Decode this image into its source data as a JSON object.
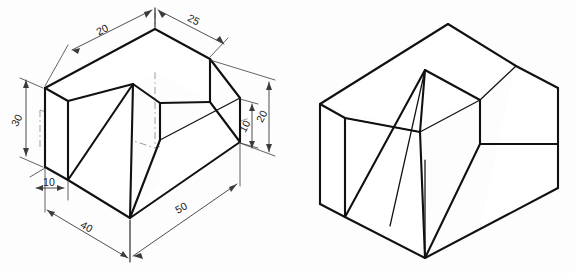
{
  "document": {
    "title": "Isometric Drawing Exercise",
    "sheet_background": "#fdfdfd",
    "line_color": "#111111",
    "dimension_color": "#3b3b3b",
    "center_line_color": "#8d8d8d"
  },
  "figures": [
    {
      "id": "figure-left",
      "name": "dimensioned-isometric-view",
      "label": "Dimensioned isometric view",
      "has_dimensions": true,
      "has_center_lines": true
    },
    {
      "id": "figure-right",
      "name": "plain-isometric-view",
      "label": "Plain isometric view",
      "has_dimensions": false,
      "has_center_lines": false
    }
  ],
  "dimensions": [
    {
      "id": "dim-top-left",
      "name": "dimension-20-top-left",
      "value": "20",
      "unit": "mm",
      "position": "top-left",
      "rotation": -58
    },
    {
      "id": "dim-top-right",
      "name": "dimension-25-top-right",
      "value": "25",
      "unit": "mm",
      "position": "top-right",
      "rotation": -58
    },
    {
      "id": "dim-left-height",
      "name": "dimension-30-left-height",
      "value": "30",
      "unit": "mm",
      "position": "left",
      "rotation": -62
    },
    {
      "id": "dim-left-base",
      "name": "dimension-10-left-base",
      "value": "10",
      "unit": "mm",
      "position": "lower-left",
      "rotation": 0
    },
    {
      "id": "dim-bottom-left",
      "name": "dimension-40-bottom-left",
      "value": "40",
      "unit": "mm",
      "position": "bottom-left",
      "rotation": 29
    },
    {
      "id": "dim-bottom-right",
      "name": "dimension-50-bottom-right",
      "value": "50",
      "unit": "mm",
      "position": "bottom-right",
      "rotation": -29
    },
    {
      "id": "dim-right-outer",
      "name": "dimension-20-right-outer",
      "value": "20",
      "unit": "mm",
      "position": "right-outer",
      "rotation": -62
    },
    {
      "id": "dim-right-inner",
      "name": "dimension-10-right-inner",
      "value": "10",
      "unit": "mm",
      "position": "right-inner",
      "rotation": -62
    }
  ]
}
